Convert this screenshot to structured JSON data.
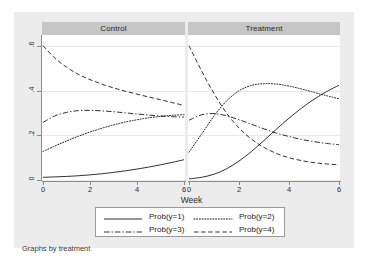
{
  "figure": {
    "caption": "Graphs by treatment",
    "background_color": "#ececed",
    "panel_title_color": "#c6c6c6",
    "plot_background": "#ffffff"
  },
  "chart_data": {
    "type": "line",
    "title": "",
    "subtitle": "",
    "xlabel": "Week",
    "ylabel": "",
    "xlim": [
      0,
      6
    ],
    "ylim": [
      0,
      0.65
    ],
    "xticks": [
      "0",
      "2",
      "4",
      "6"
    ],
    "xtick_values": [
      0,
      2,
      4,
      6
    ],
    "yticks": [
      "0",
      ".2",
      ".4",
      ".6"
    ],
    "ytick_values": [
      0,
      0.2,
      0.4,
      0.6
    ],
    "grid": true,
    "grid_axis": "y",
    "legend_position": "bottom",
    "legend_columns": 2,
    "facet_variable": "treatment",
    "panels": [
      {
        "name": "control",
        "label": "Control",
        "series": [
          {
            "name": "Prob(y=1)",
            "style": "solid",
            "x": [
              0,
              0.5,
              1,
              1.5,
              2,
              2.5,
              3,
              3.5,
              4,
              4.5,
              5,
              5.5,
              6
            ],
            "values": [
              0.012,
              0.014,
              0.016,
              0.019,
              0.023,
              0.028,
              0.034,
              0.041,
              0.049,
              0.058,
              0.068,
              0.079,
              0.091
            ]
          },
          {
            "name": "Prob(y=2)",
            "style": "dotted",
            "x": [
              0,
              0.5,
              1,
              1.5,
              2,
              2.5,
              3,
              3.5,
              4,
              4.5,
              5,
              5.5,
              6
            ],
            "values": [
              0.128,
              0.152,
              0.175,
              0.196,
              0.215,
              0.232,
              0.247,
              0.26,
              0.27,
              0.279,
              0.285,
              0.29,
              0.293
            ]
          },
          {
            "name": "Prob(y=3)",
            "style": "dash-dot",
            "x": [
              0,
              0.5,
              1,
              1.5,
              2,
              2.5,
              3,
              3.5,
              4,
              4.5,
              5,
              5.5,
              6
            ],
            "values": [
              0.258,
              0.287,
              0.303,
              0.311,
              0.312,
              0.31,
              0.306,
              0.301,
              0.296,
              0.291,
              0.287,
              0.284,
              0.282
            ]
          },
          {
            "name": "Prob(y=4)",
            "style": "dashed",
            "x": [
              0,
              0.5,
              1,
              1.5,
              2,
              2.5,
              3,
              3.5,
              4,
              4.5,
              5,
              5.5,
              6
            ],
            "values": [
              0.602,
              0.547,
              0.506,
              0.474,
              0.45,
              0.43,
              0.413,
              0.398,
              0.385,
              0.372,
              0.36,
              0.347,
              0.334
            ]
          }
        ]
      },
      {
        "name": "treatment",
        "label": "Treatment",
        "series": [
          {
            "name": "Prob(y=1)",
            "style": "solid",
            "x": [
              0,
              0.5,
              1,
              1.5,
              2,
              2.5,
              3,
              3.5,
              4,
              4.5,
              5,
              5.5,
              6
            ],
            "values": [
              0.005,
              0.012,
              0.026,
              0.05,
              0.085,
              0.128,
              0.177,
              0.228,
              0.277,
              0.322,
              0.362,
              0.396,
              0.425
            ]
          },
          {
            "name": "Prob(y=2)",
            "style": "dotted",
            "x": [
              0,
              0.5,
              1,
              1.5,
              2,
              2.5,
              3,
              3.5,
              4,
              4.5,
              5,
              5.5,
              6
            ],
            "values": [
              0.125,
              0.205,
              0.287,
              0.354,
              0.4,
              0.424,
              0.432,
              0.43,
              0.421,
              0.408,
              0.393,
              0.378,
              0.364
            ]
          },
          {
            "name": "Prob(y=3)",
            "style": "dash-dot",
            "x": [
              0,
              0.5,
              1,
              1.5,
              2,
              2.5,
              3,
              3.5,
              4,
              4.5,
              5,
              5.5,
              6
            ],
            "values": [
              0.268,
              0.292,
              0.298,
              0.288,
              0.27,
              0.25,
              0.229,
              0.21,
              0.195,
              0.182,
              0.172,
              0.164,
              0.158
            ]
          },
          {
            "name": "Prob(y=4)",
            "style": "dashed",
            "x": [
              0,
              0.5,
              1,
              1.5,
              2,
              2.5,
              3,
              3.5,
              4,
              4.5,
              5,
              5.5,
              6
            ],
            "values": [
              0.602,
              0.49,
              0.388,
              0.3,
              0.233,
              0.183,
              0.146,
              0.119,
              0.1,
              0.087,
              0.078,
              0.072,
              0.068
            ]
          }
        ]
      }
    ],
    "legend": [
      {
        "label": "Prob(y=1)",
        "style": "solid"
      },
      {
        "label": "Prob(y=2)",
        "style": "dotted"
      },
      {
        "label": "Prob(y=3)",
        "style": "dash-dot"
      },
      {
        "label": "Prob(y=4)",
        "style": "dashed"
      }
    ]
  }
}
